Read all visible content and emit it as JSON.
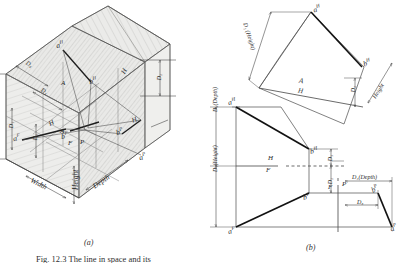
{
  "figure": {
    "caption": "Fig. 12.3   The line in space and its",
    "panel_a_label": "(a)",
    "panel_b_label": "(b)"
  },
  "panel_a": {
    "title": "pictorial glass box",
    "axis_labels": {
      "width": "Width",
      "height": "Height",
      "depth": "Depth"
    },
    "dimensions": [
      {
        "name": "D4",
        "text": "D₄"
      },
      {
        "name": "D3",
        "text": "D₃"
      },
      {
        "name": "D1",
        "text": "D₁"
      },
      {
        "name": "D2",
        "text": "D₂"
      },
      {
        "name": "D2-right",
        "text": "D₂"
      },
      {
        "name": "D3-lower",
        "text": "D₃"
      }
    ],
    "points": [
      {
        "name": "a-horizontal",
        "text": "a",
        "sup": "H"
      },
      {
        "name": "b-horizontal",
        "text": "b",
        "sup": "H"
      },
      {
        "name": "a-frontal",
        "text": "a",
        "sup": "F"
      },
      {
        "name": "b-frontal",
        "text": "b",
        "sup": "F"
      },
      {
        "name": "a-profile",
        "text": "a",
        "sup": "P"
      },
      {
        "name": "b-profile",
        "text": "b",
        "sup": "P"
      }
    ],
    "fold_marks": [
      {
        "name": "fold-A-upper",
        "text": "A"
      },
      {
        "name": "fold-H-upper",
        "text": "H"
      },
      {
        "name": "fold-A-lower",
        "text": "A"
      },
      {
        "name": "fold-H-lower",
        "text": "H"
      },
      {
        "name": "fold-F",
        "text": "F"
      },
      {
        "name": "fold-P",
        "text": "P"
      },
      {
        "name": "fold-H-right",
        "text": "H"
      }
    ]
  },
  "panel_b": {
    "title": "orthographic projections",
    "points": [
      {
        "name": "a-horizontal",
        "text": "a",
        "sup": "H"
      },
      {
        "name": "b-horizontal",
        "text": "b",
        "sup": "H"
      },
      {
        "name": "a-horizontal-left",
        "text": "a",
        "sup": "H"
      },
      {
        "name": "b-horizontal-left",
        "text": "b",
        "sup": "H"
      },
      {
        "name": "a-frontal",
        "text": "a",
        "sup": "F"
      },
      {
        "name": "b-frontal",
        "text": "b",
        "sup": "F"
      },
      {
        "name": "a-profile",
        "text": "a",
        "sup": "P"
      },
      {
        "name": "b-profile",
        "text": "b",
        "sup": "P"
      }
    ],
    "fold_lines": [
      {
        "name": "fold-A-H",
        "upper": "A",
        "lower": "H"
      },
      {
        "name": "fold-H-F",
        "upper": "H",
        "lower": "F"
      },
      {
        "name": "fold-F-P",
        "left": "F",
        "right": "P"
      }
    ],
    "dimensions": [
      {
        "name": "D1-height-auxiliary",
        "text": "D₁ (Height)"
      },
      {
        "name": "D2-auxiliary",
        "text": "D₂"
      },
      {
        "name": "height-auxiliary",
        "text": "Height"
      },
      {
        "name": "D4-depth-left",
        "text": "D₄(Depth)"
      },
      {
        "name": "D1-height-left",
        "text": "D₁(Height)"
      },
      {
        "name": "D3-upper",
        "text": "D₃"
      },
      {
        "name": "D2-lower",
        "text": "D₂"
      },
      {
        "name": "D4-depth-profile",
        "text": "D₄(Depth)"
      },
      {
        "name": "D3-profile",
        "text": "D₃"
      }
    ]
  }
}
